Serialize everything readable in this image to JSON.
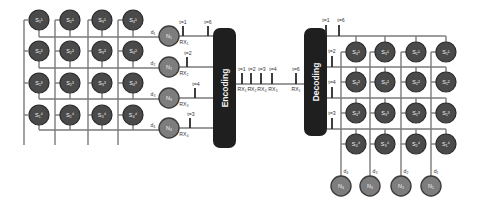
{
  "colors": {
    "s_node": "#4a4a4a",
    "n_node": "#7d7d7d",
    "box": "#1f1f1f",
    "wire": "#7a7a7a"
  },
  "left_grid": {
    "rows": [
      [
        "S₁¹",
        "S₂¹",
        "S₃¹",
        "S₄¹"
      ],
      [
        "S₁²",
        "S₂²",
        "S₃²",
        "S₄²"
      ],
      [
        "S₁³",
        "S₂³",
        "S₃³",
        "S₄³"
      ],
      [
        "S₁⁴",
        "S₂⁴",
        "S₃⁴",
        "S₄⁴"
      ]
    ],
    "row_labels": [
      "d₁",
      "d₂",
      "d₃",
      "d₄"
    ]
  },
  "left_nodes": [
    {
      "label": "N₁",
      "rx": "RX₁",
      "t": "t=1",
      "t2": "t=6"
    },
    {
      "label": "N₂",
      "rx": "RX₂",
      "t": "t=2"
    },
    {
      "label": "N₃",
      "rx": "RX₃",
      "t": "t=4"
    },
    {
      "label": "N₄",
      "rx": "RX₄",
      "t": "t=3"
    }
  ],
  "encoder": {
    "label": "Encoding"
  },
  "decoder": {
    "label": "Decoding"
  },
  "channel": {
    "ticks": [
      {
        "t": "t=1",
        "rx": "RX₁"
      },
      {
        "t": "t=2",
        "rx": "RX₂"
      },
      {
        "t": "t=3",
        "rx": "RX₄"
      },
      {
        "t": "t=4",
        "rx": "RX₃"
      },
      {
        "t": "t=6",
        "rx": "RX₁"
      }
    ]
  },
  "right_ticks": [
    "t=1",
    "t=6",
    "t=2",
    "t=4",
    "t=3"
  ],
  "right_grid": {
    "rows": [
      [
        "S₄¹",
        "S₃¹",
        "S₂¹",
        "S₁¹"
      ],
      [
        "S₄²",
        "S₃²",
        "S₂²",
        "S₁²"
      ],
      [
        "S₄³",
        "S₃³",
        "S₂³",
        "S₁³"
      ],
      [
        "S₄⁴",
        "S₃⁴",
        "S₂⁴",
        "S₁⁴"
      ]
    ]
  },
  "right_nodes": [
    {
      "label": "N₄",
      "d": "d₄"
    },
    {
      "label": "N₃",
      "d": "d₃"
    },
    {
      "label": "N₂",
      "d": "d₂"
    },
    {
      "label": "N₁",
      "d": "d₁"
    }
  ]
}
